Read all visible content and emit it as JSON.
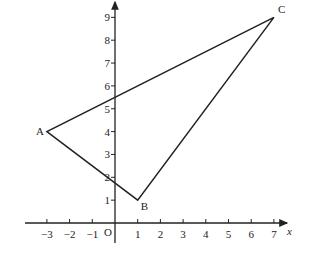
{
  "diagram": {
    "type": "coordinate-geometry",
    "axes": {
      "x_label": "x",
      "y_label": "y",
      "origin_label": "O",
      "x_ticks": [
        "−3",
        "−2",
        "−1",
        "1",
        "2",
        "3",
        "4",
        "5",
        "6",
        "7"
      ],
      "y_ticks": [
        "1",
        "2",
        "3",
        "4",
        "5",
        "6",
        "7",
        "8",
        "9"
      ]
    },
    "vertices": [
      {
        "name": "A",
        "x": -3,
        "y": 4
      },
      {
        "name": "B",
        "x": 1,
        "y": 1
      },
      {
        "name": "C",
        "x": 7,
        "y": 9
      }
    ],
    "shape": "triangle ABC"
  }
}
